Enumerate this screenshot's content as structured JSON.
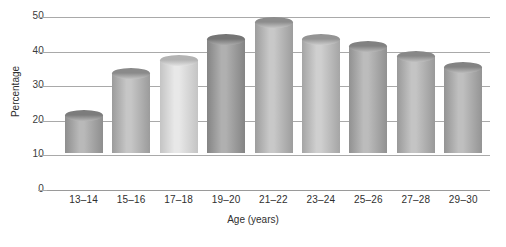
{
  "chart_data": {
    "type": "bar",
    "title": "",
    "subtitle": "",
    "xlabel": "Age (years)",
    "ylabel": "Percentage",
    "categories": [
      "13–14",
      "15–16",
      "17–18",
      "19–20",
      "21–22",
      "23–24",
      "25–26",
      "27–28",
      "29–30"
    ],
    "values": [
      11,
      23,
      27,
      33,
      38,
      33,
      31,
      28,
      25
    ],
    "ylim": [
      0,
      50
    ],
    "yticks": [
      0,
      10,
      20,
      30,
      40,
      50
    ],
    "ytick_labels": [
      "0",
      "10",
      "20",
      "30",
      "40",
      "50"
    ],
    "grid": true,
    "legend": null,
    "legend_position": "none",
    "annotations": [],
    "bar_style": "3d-cylinder",
    "series": [
      {
        "name": "Percentage",
        "values": [
          11,
          23,
          27,
          33,
          38,
          33,
          31,
          28,
          25
        ]
      }
    ],
    "bar_colors": [
      {
        "category": "13–14",
        "light": "#b9b9b9",
        "dark": "#8e8e8e",
        "cap_light": "#b6b6b6",
        "cap_dark": "#7c7c7c"
      },
      {
        "category": "15–16",
        "light": "#c6c6c6",
        "dark": "#9b9b9b",
        "cap_light": "#c2c2c2",
        "cap_dark": "#8a8a8a"
      },
      {
        "category": "17–18",
        "light": "#e8e8e8",
        "dark": "#c4c4c4",
        "cap_light": "#e2e2e2",
        "cap_dark": "#b3b3b3"
      },
      {
        "category": "19–20",
        "light": "#b0b0b0",
        "dark": "#848484",
        "cap_light": "#ababab",
        "cap_dark": "#757575"
      },
      {
        "category": "21–22",
        "light": "#c8c8c8",
        "dark": "#9d9d9d",
        "cap_light": "#c4c4c4",
        "cap_dark": "#8c8c8c"
      },
      {
        "category": "23–24",
        "light": "#cfcfcf",
        "dark": "#a5a5a5",
        "cap_light": "#cbcbcb",
        "cap_dark": "#949494"
      },
      {
        "category": "25–26",
        "light": "#bcbcbc",
        "dark": "#919191",
        "cap_light": "#b8b8b8",
        "cap_dark": "#818181"
      },
      {
        "category": "27–28",
        "light": "#c4c4c4",
        "dark": "#999999",
        "cap_light": "#c0c0c0",
        "cap_dark": "#888888"
      },
      {
        "category": "29–30",
        "light": "#bfbfbf",
        "dark": "#949494",
        "cap_light": "#bbbbbb",
        "cap_dark": "#838383"
      }
    ],
    "axis_color": "#a9a9a9",
    "text_color": "#2f2f2f",
    "background": "#ffffff"
  }
}
